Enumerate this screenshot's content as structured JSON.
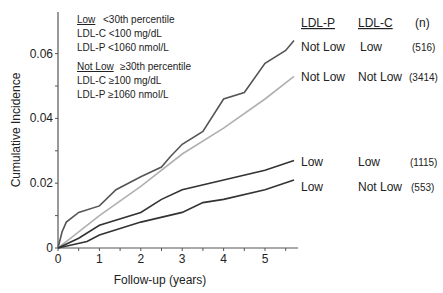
{
  "chart_data": {
    "type": "line",
    "title": "",
    "xlabel": "Follow-up (years)",
    "ylabel": "Cumulative Incidence",
    "xlim": [
      0,
      5.8
    ],
    "ylim": [
      0,
      0.07
    ],
    "x_ticks": [
      "0",
      "1",
      "2",
      "3",
      "4",
      "5"
    ],
    "y_ticks": [
      "0",
      "0.02",
      "0.04",
      "0.06"
    ],
    "grid": false,
    "legend_box": {
      "low_title": "Low",
      "low_desc": "<30th percentile",
      "low_c": "LDL-C <100 mg/dL",
      "low_p": "LDL-P <1060 nmol/L",
      "notlow_title": "Not Low",
      "notlow_desc": "≥30th percentile",
      "notlow_c": "LDL-C ≥100 mg/dL",
      "notlow_p": "LDL-P ≥1060 nmol/L"
    },
    "table_headers": [
      "LDL-P",
      "LDL-C",
      "(n)"
    ],
    "series": [
      {
        "name": "LDL-P Not Low / LDL-C Low",
        "ldlp": "Not Low",
        "ldlc": "Low",
        "n": "(516)",
        "color": "#555555",
        "x": [
          0,
          0.1,
          0.2,
          0.5,
          1,
          1.4,
          2,
          2.5,
          2.7,
          3,
          3.5,
          4,
          4.5,
          5,
          5.5,
          5.7
        ],
        "y": [
          0,
          0.005,
          0.008,
          0.011,
          0.013,
          0.018,
          0.022,
          0.025,
          0.028,
          0.032,
          0.036,
          0.046,
          0.048,
          0.057,
          0.061,
          0.064
        ]
      },
      {
        "name": "LDL-P Not Low / LDL-C Not Low",
        "ldlp": "Not Low",
        "ldlc": "Not Low",
        "n": "(3414)",
        "color": "#b0b0b0",
        "x": [
          0,
          0.3,
          1,
          2,
          3,
          4,
          5,
          5.7
        ],
        "y": [
          0,
          0.003,
          0.01,
          0.019,
          0.029,
          0.037,
          0.046,
          0.053
        ]
      },
      {
        "name": "LDL-P Low / LDL-C Low",
        "ldlp": "Low",
        "ldlc": "Low",
        "n": "(1115)",
        "color": "#333333",
        "x": [
          0,
          0.5,
          1,
          2,
          2.5,
          3,
          4,
          5,
          5.7
        ],
        "y": [
          0,
          0.003,
          0.007,
          0.011,
          0.015,
          0.018,
          0.021,
          0.024,
          0.027
        ]
      },
      {
        "name": "LDL-P Low / LDL-C Not Low",
        "ldlp": "Low",
        "ldlc": "Not Low",
        "n": "(553)",
        "color": "#333333",
        "x": [
          0,
          0.7,
          1,
          2,
          3,
          3.5,
          4,
          5,
          5.7
        ],
        "y": [
          0,
          0.002,
          0.004,
          0.008,
          0.011,
          0.014,
          0.015,
          0.018,
          0.021
        ]
      }
    ]
  }
}
